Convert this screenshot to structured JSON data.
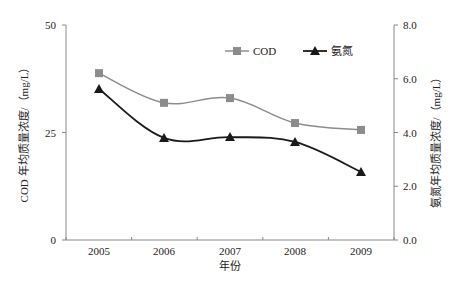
{
  "chart_data": {
    "type": "line",
    "title": "",
    "categories": [
      "2005",
      "2006",
      "2007",
      "2008",
      "2009"
    ],
    "xlabel": "年份",
    "ylabel": "COD 年均质量浓度/（mg/L）",
    "y2label": "氨氮年均质量浓度/（mg/L）",
    "ylim": [
      0,
      50
    ],
    "y2lim": [
      0,
      8
    ],
    "yticks": [
      "0",
      "25",
      "50"
    ],
    "y2ticks": [
      "0.0",
      "2.0",
      "4.0",
      "6.0",
      "8.0"
    ],
    "grid": false,
    "legend_position": "top-right inside",
    "series": [
      {
        "name": "COD",
        "axis": "left",
        "marker": "square",
        "color": "#8c8c8c",
        "values": [
          38.8,
          31.9,
          33.0,
          27.2,
          25.6
        ]
      },
      {
        "name": "氨氮",
        "axis": "right",
        "marker": "triangle",
        "color": "#1a1a1a",
        "values": [
          5.62,
          3.8,
          3.83,
          3.65,
          2.53
        ]
      }
    ]
  }
}
